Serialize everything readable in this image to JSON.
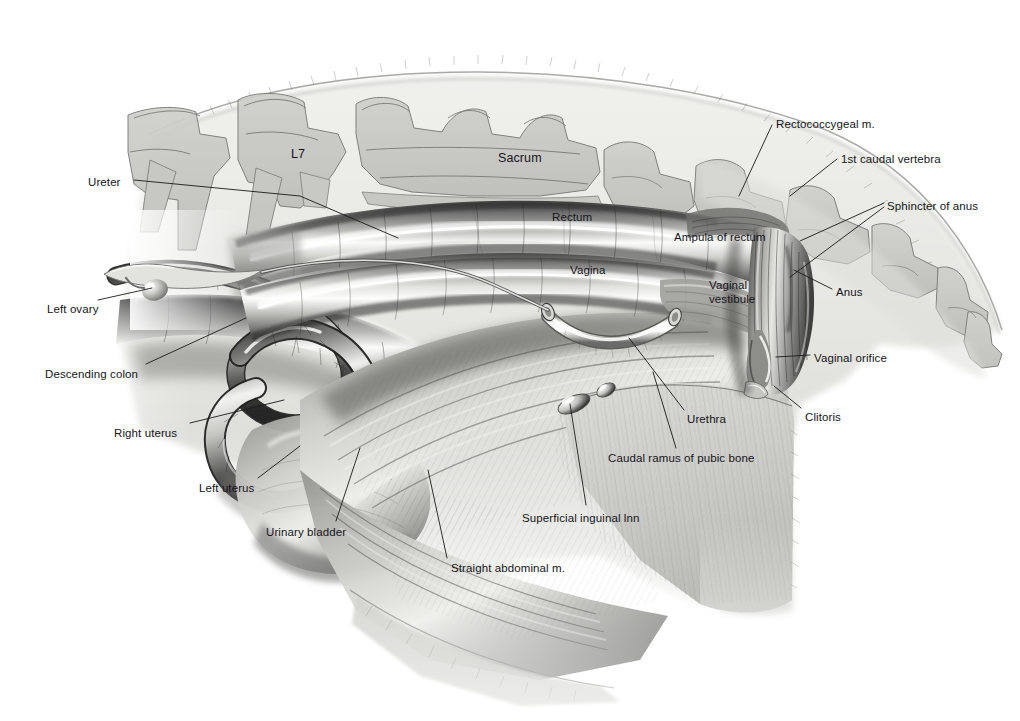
{
  "figure": {
    "domain": "anatomical-illustration",
    "style": "grayscale airbrush medical illustration on white background",
    "background_color": "#ffffff",
    "tissue_base_color": "#e7e7e4",
    "bone_fill_color": "#c9c9c6",
    "bone_outline_color": "#6e6e6e",
    "label_color": "#16161a",
    "leader_color": "#1a1a1a"
  },
  "labels": [
    {
      "id": "ureter",
      "text": "Ureter",
      "x": 88,
      "y": 176,
      "anchor": "left"
    },
    {
      "id": "l7",
      "text": "L7",
      "x": 291,
      "y": 148,
      "anchor": "left"
    },
    {
      "id": "sacrum",
      "text": "Sacrum",
      "x": 498,
      "y": 152,
      "anchor": "left"
    },
    {
      "id": "rectococcygeal",
      "text": "Rectococcygeal m.",
      "x": 776,
      "y": 118,
      "anchor": "left"
    },
    {
      "id": "caudal_vertebra",
      "text": "1st caudal vertebra",
      "x": 841,
      "y": 153,
      "anchor": "left"
    },
    {
      "id": "sphincter_anus",
      "text": "Sphincter of anus",
      "x": 887,
      "y": 200,
      "anchor": "left"
    },
    {
      "id": "rectum",
      "text": "Rectum",
      "x": 552,
      "y": 211,
      "anchor": "left"
    },
    {
      "id": "ampula_rectum",
      "text": "Ampula of rectum",
      "x": 674,
      "y": 231,
      "anchor": "left"
    },
    {
      "id": "vagina",
      "text": "Vagina",
      "x": 570,
      "y": 264,
      "anchor": "left"
    },
    {
      "id": "vaginal_vestibule",
      "text": "Vaginal vestibule",
      "x": 709,
      "y": 279,
      "anchor": "left",
      "wrap": true
    },
    {
      "id": "anus",
      "text": "Anus",
      "x": 836,
      "y": 286,
      "anchor": "left"
    },
    {
      "id": "left_ovary",
      "text": "Left ovary",
      "x": 47,
      "y": 303,
      "anchor": "left"
    },
    {
      "id": "vaginal_orifice",
      "text": "Vaginal orifice",
      "x": 814,
      "y": 352,
      "anchor": "left"
    },
    {
      "id": "descending_colon",
      "text": "Descending colon",
      "x": 45,
      "y": 368,
      "anchor": "left"
    },
    {
      "id": "clitoris",
      "text": "Clitoris",
      "x": 805,
      "y": 411,
      "anchor": "left"
    },
    {
      "id": "urethra",
      "text": "Urethra",
      "x": 687,
      "y": 413,
      "anchor": "left"
    },
    {
      "id": "right_uterus",
      "text": "Right uterus",
      "x": 114,
      "y": 427,
      "anchor": "left"
    },
    {
      "id": "caudal_ramus",
      "text": "Caudal ramus of pubic bone",
      "x": 608,
      "y": 452,
      "anchor": "left"
    },
    {
      "id": "left_uterus",
      "text": "Left uterus",
      "x": 199,
      "y": 482,
      "anchor": "left"
    },
    {
      "id": "sup_inguinal_lnn",
      "text": "Superficial inguinal lnn",
      "x": 522,
      "y": 512,
      "anchor": "left"
    },
    {
      "id": "urinary_bladder",
      "text": "Urinary bladder",
      "x": 266,
      "y": 526,
      "anchor": "left"
    },
    {
      "id": "straight_abdominal",
      "text": "Straight abdominal m.",
      "x": 451,
      "y": 562,
      "anchor": "left"
    }
  ],
  "leader_lines": [
    {
      "for": "ureter",
      "points": "134,180 300,196 398,238"
    },
    {
      "for": "rectococcygeal",
      "points": "772,125 739,196"
    },
    {
      "for": "caudal_vertebra",
      "points": "837,159 790,196"
    },
    {
      "for": "sphincter_anus",
      "points": "884,203 800,241"
    },
    {
      "for": "sphincter_anus_2",
      "points": "884,207 790,277"
    },
    {
      "for": "anus",
      "points": "832,289 794,270"
    },
    {
      "for": "left_ovary",
      "points": "98,300 152,288"
    },
    {
      "for": "vaginal_orifice",
      "points": "810,355 776,357"
    },
    {
      "for": "descending_colon",
      "points": "146,364 246,318"
    },
    {
      "for": "clitoris",
      "points": "801,408 774,386"
    },
    {
      "for": "urethra",
      "points": "684,410 629,338"
    },
    {
      "for": "right_uterus",
      "points": "190,423 284,400"
    },
    {
      "for": "caudal_ramus",
      "points": "676,448 653,372"
    },
    {
      "for": "left_uterus",
      "points": "258,478 300,446"
    },
    {
      "for": "sup_inguinal_lnn",
      "points": "586,505 570,404"
    },
    {
      "for": "urinary_bladder",
      "points": "336,521 360,448"
    },
    {
      "for": "straight_abdominal",
      "points": "447,558 428,470"
    }
  ]
}
